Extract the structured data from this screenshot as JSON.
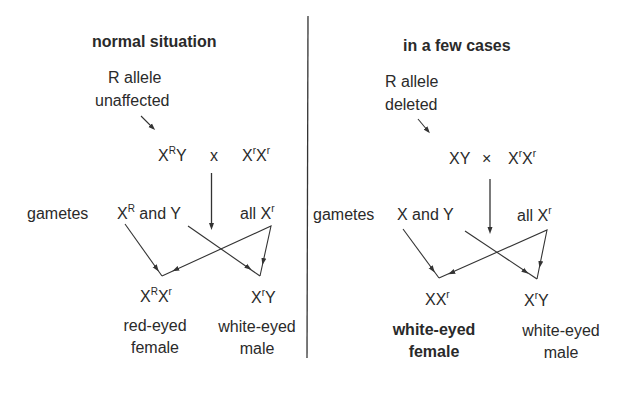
{
  "panels": {
    "left": {
      "title": "normal situation",
      "note_line1": "R allele",
      "note_line2": "unaffected",
      "parents": {
        "male": {
          "base": "X",
          "sup": "R",
          "after": "Y"
        },
        "cross_symbol": "x",
        "female": {
          "base1": "X",
          "sup1": "r",
          "base2": "X",
          "sup2": "r"
        }
      },
      "gametes_label": "gametes",
      "male_gametes": {
        "base": "X",
        "sup": "R",
        "after": " and Y"
      },
      "female_gametes": {
        "prefix": "all X",
        "sup": "r"
      },
      "offspring": [
        {
          "genotype": {
            "base1": "X",
            "sup1": "R",
            "base2": "X",
            "sup2": "r"
          },
          "phenotype_line1": "red-eyed",
          "phenotype_line2": "female",
          "bold": false
        },
        {
          "genotype": {
            "base1": "X",
            "sup1": "r",
            "base2": "Y",
            "sup2": ""
          },
          "phenotype_line1": "white-eyed",
          "phenotype_line2": "male",
          "bold": false
        }
      ]
    },
    "right": {
      "title": "in a few cases",
      "note_line1": "R allele",
      "note_line2": "deleted",
      "parents": {
        "male": {
          "base": "XY"
        },
        "cross_symbol": "×",
        "female": {
          "base1": "X",
          "sup1": "r",
          "base2": "X",
          "sup2": "r"
        }
      },
      "gametes_label": "gametes",
      "male_gametes": {
        "text": "X and Y"
      },
      "female_gametes": {
        "prefix": "all X",
        "sup": "r"
      },
      "offspring": [
        {
          "genotype": {
            "base1": "XX",
            "sup1": "r"
          },
          "phenotype_line1": "white-eyed",
          "phenotype_line2": "female",
          "bold": true
        },
        {
          "genotype": {
            "base1": "X",
            "sup1": "r",
            "base2": "Y"
          },
          "phenotype_line1": "white-eyed",
          "phenotype_line2": "male",
          "bold": false
        }
      ]
    }
  },
  "colors": {
    "ink": "#2a2a2a",
    "background": "#ffffff",
    "divider": "#333333"
  }
}
